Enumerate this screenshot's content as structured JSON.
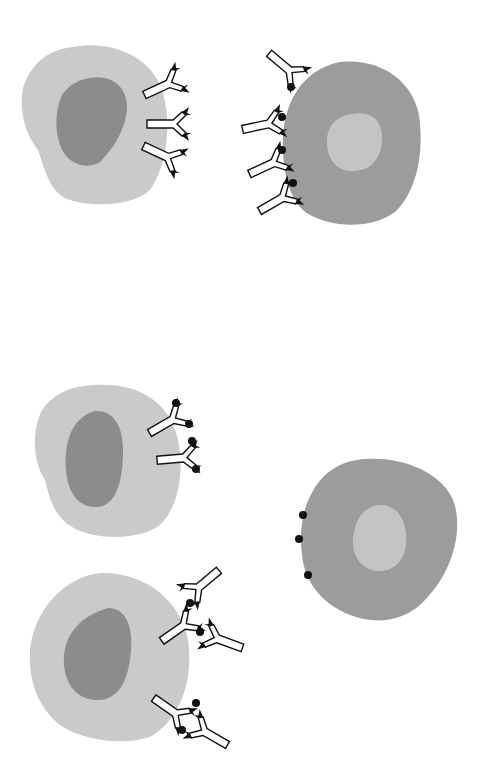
{
  "diagram": {
    "type": "immunology-schematic",
    "colors": {
      "background": "#ffffff",
      "light_cell": "#cacaca",
      "dark_nucleus": "#8c8c8c",
      "dark_cell": "#9c9c9c",
      "light_nucleus": "#c4c4c4",
      "antibody_fill": "#ffffff",
      "antibody_stroke": "#111111",
      "antigen": "#111111"
    },
    "panels": [
      {
        "name": "top",
        "cells": [
          {
            "role": "effector-cell",
            "shade": "light",
            "antibodies": 3,
            "antigen_bound": false
          },
          {
            "role": "target-cell",
            "shade": "dark",
            "antibodies": 4,
            "antigen_bound": true
          }
        ]
      },
      {
        "name": "bottom",
        "cells": [
          {
            "role": "effector-cell",
            "shade": "light",
            "antibodies": 2,
            "antigen_bound": true
          },
          {
            "role": "target-cell",
            "shade": "dark",
            "antibodies": 0,
            "free_antigens": 3
          },
          {
            "role": "effector-cell",
            "shade": "light",
            "antibodies": 5,
            "cross_linked": true
          }
        ]
      }
    ]
  }
}
